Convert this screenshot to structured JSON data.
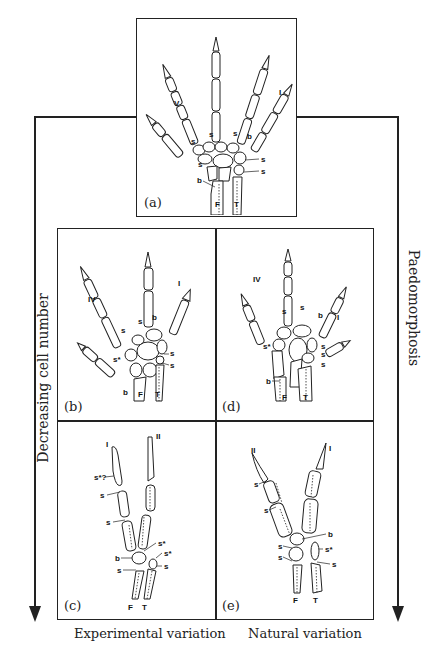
{
  "figure": {
    "panels": {
      "a": {
        "label": "(a)",
        "digit_labels": [
          "V",
          "I"
        ],
        "bone_labels": [
          "s",
          "s",
          "s",
          "b",
          "s",
          "s",
          "s",
          "s",
          "b"
        ],
        "limb_labels": [
          "F",
          "T"
        ]
      },
      "b": {
        "label": "(b)",
        "digit_labels": [
          "IV",
          "I"
        ],
        "bone_labels": [
          "s",
          "b",
          "s",
          "s*",
          "s",
          "s",
          "b"
        ],
        "limb_labels": [
          "F",
          "T"
        ]
      },
      "c": {
        "label": "(c)",
        "digit_labels": [
          "I",
          "II"
        ],
        "bone_labels": [
          "s*?",
          "s",
          "s",
          "s*",
          "b",
          "s*",
          "s",
          "s"
        ],
        "limb_labels": [
          "F",
          "T"
        ]
      },
      "d": {
        "label": "(d)",
        "digit_labels": [
          "IV",
          "I"
        ],
        "bone_labels": [
          "s",
          "s",
          "b",
          "s*",
          "s",
          "s",
          "s",
          "b"
        ],
        "limb_labels": [
          "F",
          "T"
        ]
      },
      "e": {
        "label": "(e)",
        "digit_labels": [
          "II",
          "I"
        ],
        "bone_labels": [
          "s",
          "s",
          "b",
          "s",
          "s*",
          "s",
          "s"
        ],
        "limb_labels": [
          "F",
          "T"
        ]
      }
    },
    "left_axis": {
      "label": "Decreasing cell number"
    },
    "right_axis": {
      "label": "Paedomorphosis"
    },
    "bottom_captions": {
      "left": "Experimental variation",
      "right": "Natural variation"
    }
  }
}
